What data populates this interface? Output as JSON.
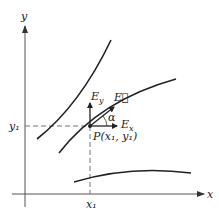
{
  "diagram": {
    "axes": {
      "x_label": "x",
      "y_label": "y"
    },
    "point": {
      "label": "P(x₁, y₁)",
      "x_tick": "x₁",
      "y_tick": "y₁"
    },
    "vectors": {
      "E": "E⃗",
      "Ex": "E",
      "Ex_sub": "x",
      "Ey": "E",
      "Ey_sub": "y",
      "angle": "α"
    },
    "colors": {
      "line": "#222222",
      "dashed": "#777777",
      "axis": "#555555"
    }
  }
}
